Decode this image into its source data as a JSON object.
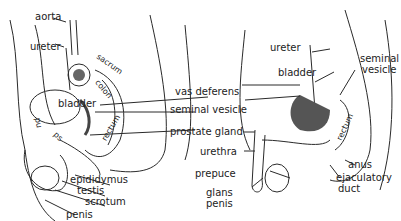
{
  "left_diagram": {
    "labels": {
      "aorta": "aorta",
      "ureter": "ureter",
      "sacrum": "sacrum",
      "colon": "colon",
      "bladder": "bladder",
      "rectum": "rectum",
      "pu": "pu",
      "ps": "ps",
      "epididymus": "epididymus",
      "testis": "testis",
      "scrotum": "scrotum",
      "penis": "penis"
    }
  },
  "center_labels": {
    "vas_deferens": "vas deferens",
    "seminal_vesicle": "seminal vesicle",
    "prostate_gland": "prostate gland",
    "urethra": "urethra",
    "prepuce": "prepuce",
    "glans_penis_1": "glans",
    "glans_penis_2": "penis"
  },
  "right_diagram": {
    "labels": {
      "ureter": "ureter",
      "bladder": "bladder",
      "seminal_vesicle_1": "seminal",
      "seminal_vesicle_2": "vesicle",
      "rectum": "rectum",
      "anus": "anus",
      "ejaculatory_duct_1": "ejaculatory",
      "ejaculatory_duct_2": "duct"
    }
  },
  "colors": {
    "line": "#2a2a2a",
    "shade": "#555555",
    "background": "#ffffff"
  }
}
